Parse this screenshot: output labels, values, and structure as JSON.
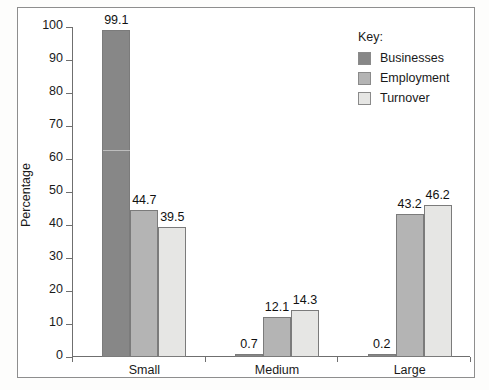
{
  "chart_data": {
    "type": "bar",
    "title": "",
    "subtitle": "",
    "xlabel": "",
    "ylabel": "Percentage",
    "ylim": [
      0,
      100
    ],
    "ytick_step": 10,
    "yticks": [
      0,
      10,
      20,
      30,
      40,
      50,
      60,
      70,
      80,
      90,
      100
    ],
    "ytick_labels": [
      "0",
      "10",
      "20",
      "30",
      "40",
      "50",
      "60",
      "70",
      "80",
      "90",
      "100"
    ],
    "categories": [
      "Small",
      "Medium",
      "Large"
    ],
    "grid": false,
    "legend_position": "top-right",
    "legend_title": "Key:",
    "series": [
      {
        "name": "Businesses",
        "color": "#878787",
        "values": [
          99.1,
          0.7,
          0.2
        ],
        "value_labels": [
          "99.1",
          "0.7",
          "0.2"
        ]
      },
      {
        "name": "Employment",
        "color": "#b4b4b4",
        "values": [
          44.7,
          12.1,
          43.2
        ],
        "value_labels": [
          "44.7",
          "12.1",
          "43.2"
        ]
      },
      {
        "name": "Turnover",
        "color": "#e6e6e4",
        "values": [
          39.5,
          14.3,
          46.2
        ],
        "value_labels": [
          "39.5",
          "14.3",
          "46.2"
        ]
      }
    ]
  },
  "legend": {
    "title": "Key:",
    "items": [
      {
        "label": "Businesses",
        "color": "#878787"
      },
      {
        "label": "Employment",
        "color": "#b4b4b4"
      },
      {
        "label": "Turnover",
        "color": "#e6e6e4"
      }
    ]
  },
  "axes": {
    "y_title": "Percentage",
    "y_labels": [
      "100",
      "90",
      "80",
      "70",
      "60",
      "50",
      "40",
      "30",
      "20",
      "10",
      "0"
    ],
    "x_labels": [
      "Small",
      "Medium",
      "Large"
    ]
  },
  "colors": {
    "axis": "#6f6f6f",
    "frame": "#8e8e8e",
    "bar_border": "#7b7b7b",
    "text": "#1a1a1a",
    "background": "#ffffff"
  }
}
